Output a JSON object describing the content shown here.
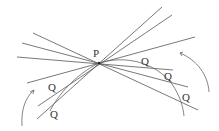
{
  "diagram": {
    "point_label": "P",
    "q_label": "Q",
    "point": {
      "x": 99,
      "y": 63
    },
    "labels": [
      {
        "text": "P",
        "x": 93,
        "y": 57
      },
      {
        "text": "Q",
        "x": 141,
        "y": 65
      },
      {
        "text": "Q",
        "x": 164,
        "y": 80
      },
      {
        "text": "Q",
        "x": 182,
        "y": 101
      },
      {
        "text": "Q",
        "x": 48,
        "y": 91
      },
      {
        "text": "Q",
        "x": 50,
        "y": 118
      }
    ],
    "lines": [
      {
        "x1": 37,
        "y1": 119,
        "x2": 162,
        "y2": 7
      },
      {
        "x1": 38,
        "y1": 106,
        "x2": 172,
        "y2": 15
      },
      {
        "x1": 27,
        "y1": 83,
        "x2": 195,
        "y2": 37
      },
      {
        "x1": 33,
        "y1": 33,
        "x2": 198,
        "y2": 110
      },
      {
        "x1": 22,
        "y1": 43,
        "x2": 188,
        "y2": 87
      },
      {
        "x1": 17,
        "y1": 57,
        "x2": 173,
        "y2": 70
      }
    ],
    "colors": {
      "line": "#555555",
      "curve": "#666666",
      "text": "#333333"
    }
  }
}
